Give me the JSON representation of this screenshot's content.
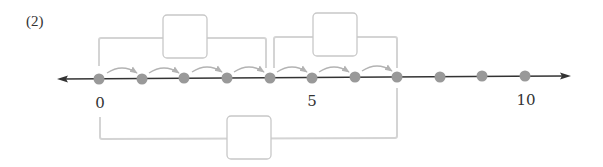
{
  "problem": {
    "label": "(2)"
  },
  "number_line": {
    "min": 0,
    "max": 10,
    "tick_labels": [
      {
        "value": 0,
        "text": "0"
      },
      {
        "value": 5,
        "text": "5"
      },
      {
        "value": 10,
        "text": "10"
      }
    ],
    "points": [
      0,
      1,
      2,
      3,
      4,
      5,
      6,
      7,
      8,
      9,
      10
    ],
    "hops": [
      {
        "from": 0,
        "to": 1
      },
      {
        "from": 1,
        "to": 2
      },
      {
        "from": 2,
        "to": 3
      },
      {
        "from": 3,
        "to": 4
      },
      {
        "from": 4,
        "to": 5
      },
      {
        "from": 5,
        "to": 6
      },
      {
        "from": 6,
        "to": 7
      }
    ],
    "colors": {
      "axis": "#333333",
      "dot": "#999999",
      "hop": "#b3b3b3",
      "bracket": "#d4d4d4",
      "box_border": "#c8c8c8"
    }
  },
  "answer_boxes": [
    {
      "id": "top-left",
      "spans": [
        0,
        4
      ],
      "value": ""
    },
    {
      "id": "top-right",
      "spans": [
        4,
        7
      ],
      "value": ""
    },
    {
      "id": "bottom",
      "spans": [
        0,
        7
      ],
      "value": ""
    }
  ]
}
